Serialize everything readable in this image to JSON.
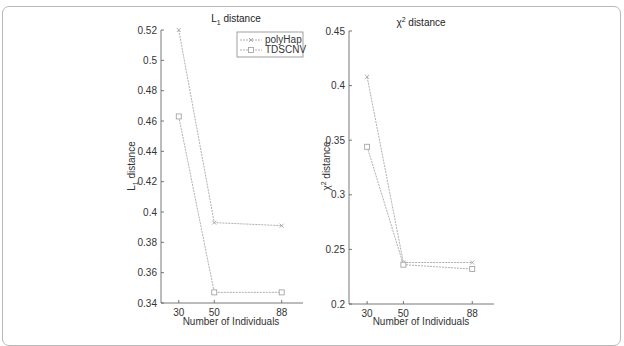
{
  "chart_data": [
    {
      "type": "line",
      "title": "L1 distance",
      "title_main": "L",
      "title_sub": "1",
      "title_rest": " distance",
      "xlabel": "Number of Individuals",
      "ylabel": "L1 distance",
      "ylabel_main": "L",
      "ylabel_sub": "1",
      "ylabel_rest": " distance",
      "x": [
        30,
        50,
        88
      ],
      "x_ticks": [
        "30",
        "50",
        "88"
      ],
      "ylim": [
        0.34,
        0.52
      ],
      "y_ticks": [
        "0.34",
        "0.36",
        "0.38",
        "0.4",
        "0.42",
        "0.44",
        "0.46",
        "0.48",
        "0.5",
        "0.52"
      ],
      "grid": false,
      "legend_position": "upper right",
      "series": [
        {
          "name": "polyHap",
          "marker": "x",
          "values": [
            0.52,
            0.393,
            0.391
          ]
        },
        {
          "name": "TDSCNV",
          "marker": "square",
          "values": [
            0.463,
            0.347,
            0.347
          ]
        }
      ]
    },
    {
      "type": "line",
      "title": "χ2 distance",
      "title_main": "χ",
      "title_sup": "2",
      "title_rest": " distance",
      "xlabel": "Number of Individuals",
      "ylabel": "χ2 distance",
      "ylabel_main": "χ",
      "ylabel_sup": "2",
      "ylabel_rest": " distance",
      "x": [
        30,
        50,
        88
      ],
      "x_ticks": [
        "30",
        "50",
        "88"
      ],
      "ylim": [
        0.2,
        0.45
      ],
      "y_ticks": [
        "0.2",
        "0.25",
        "0.3",
        "0.35",
        "0.4",
        "0.45"
      ],
      "grid": false,
      "legend_position": "none",
      "series": [
        {
          "name": "polyHap",
          "marker": "x",
          "values": [
            0.408,
            0.238,
            0.238
          ]
        },
        {
          "name": "TDSCNV",
          "marker": "square",
          "values": [
            0.344,
            0.236,
            0.232
          ]
        }
      ]
    }
  ],
  "legend": {
    "items": [
      "polyHap",
      "TDSCNV"
    ]
  },
  "colors": {
    "line": "#9a9a9a",
    "axis": "#555555",
    "frame": "#b8b8b8"
  }
}
